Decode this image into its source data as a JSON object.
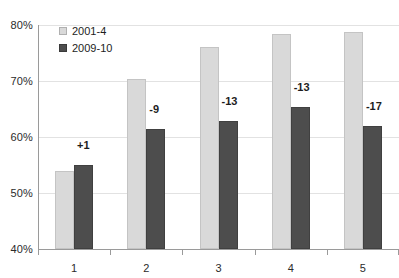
{
  "chart_data": {
    "type": "bar",
    "title": "",
    "subtitle": "",
    "xlabel": "",
    "ylabel": "",
    "categories": [
      "1",
      "2",
      "3",
      "4",
      "5"
    ],
    "ylim": [
      40,
      80
    ],
    "ytick_labels": [
      "40%",
      "50%",
      "60%",
      "70%",
      "80%"
    ],
    "ytick_values": [
      40,
      50,
      60,
      70,
      80
    ],
    "grid": true,
    "legend_position": "top-left-inside",
    "series": [
      {
        "name": "2001-4",
        "color": "#d9d9d9",
        "values": [
          54,
          70.4,
          76.1,
          78.4,
          78.7
        ]
      },
      {
        "name": "2009-10",
        "color": "#4d4d4d",
        "values": [
          55,
          61.5,
          62.9,
          65.4,
          62
        ]
      }
    ],
    "annotations": [
      "+1",
      "-9",
      "-13",
      "-13",
      "-17"
    ]
  },
  "legend": {
    "items": [
      {
        "label": "2001-4",
        "swatch": "light-gray-square"
      },
      {
        "label": "2009-10",
        "swatch": "dark-gray-square"
      }
    ]
  },
  "axes": {
    "y_labels": [
      "80%",
      "70%",
      "60%",
      "50%",
      "40%"
    ],
    "x_labels": [
      "1",
      "2",
      "3",
      "4",
      "5"
    ]
  },
  "colors": {
    "series_a": "#d9d9d9",
    "series_b": "#4d4d4d",
    "gridline": "#e2e2e2",
    "axis": "#9a9a9a",
    "text": "#1d1d1d",
    "background": "#ffffff"
  }
}
